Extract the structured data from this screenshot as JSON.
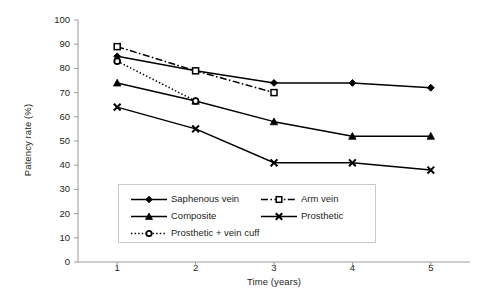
{
  "chart_data": {
    "type": "line",
    "title": "",
    "xlabel": "Time (years)",
    "ylabel": "Patency rate (%)",
    "x": [
      1,
      2,
      3,
      4,
      5
    ],
    "xtick_labels": [
      "1",
      "2",
      "3",
      "4",
      "5"
    ],
    "xlim": [
      0.5,
      5.5
    ],
    "ylim": [
      0,
      100
    ],
    "ytick_labels": [
      "0",
      "10",
      "20",
      "30",
      "40",
      "50",
      "60",
      "70",
      "80",
      "90",
      "100"
    ],
    "yticks": [
      0,
      10,
      20,
      30,
      40,
      50,
      60,
      70,
      80,
      90,
      100
    ],
    "grid": false,
    "legend_position": "inside-lower-center",
    "series": [
      {
        "name": "Saphenous vein",
        "marker": "filled-diamond",
        "linestyle": "solid",
        "color": "#000000",
        "x": [
          1,
          2,
          3,
          4,
          5
        ],
        "values": [
          85,
          79,
          74,
          74,
          72
        ]
      },
      {
        "name": "Arm vein",
        "marker": "open-square",
        "linestyle": "dashdot",
        "color": "#000000",
        "x": [
          1,
          2,
          3
        ],
        "values": [
          89,
          79,
          70
        ]
      },
      {
        "name": "Composite",
        "marker": "filled-triangle",
        "linestyle": "solid",
        "color": "#000000",
        "x": [
          1,
          2,
          3,
          4,
          5
        ],
        "values": [
          74,
          66.5,
          58,
          52,
          52
        ]
      },
      {
        "name": "Prosthetic",
        "marker": "cross-x",
        "linestyle": "solid",
        "color": "#000000",
        "x": [
          1,
          2,
          3,
          4,
          5
        ],
        "values": [
          64,
          55,
          41,
          41,
          38
        ]
      },
      {
        "name": "Prosthetic + vein cuff",
        "marker": "open-circle",
        "linestyle": "dotted",
        "color": "#000000",
        "x": [
          1,
          2
        ],
        "values": [
          83,
          66.5
        ]
      }
    ],
    "legend_entries": [
      "Saphenous vein",
      "Arm vein",
      "Composite",
      "Prosthetic",
      "Prosthetic + vein cuff"
    ]
  }
}
